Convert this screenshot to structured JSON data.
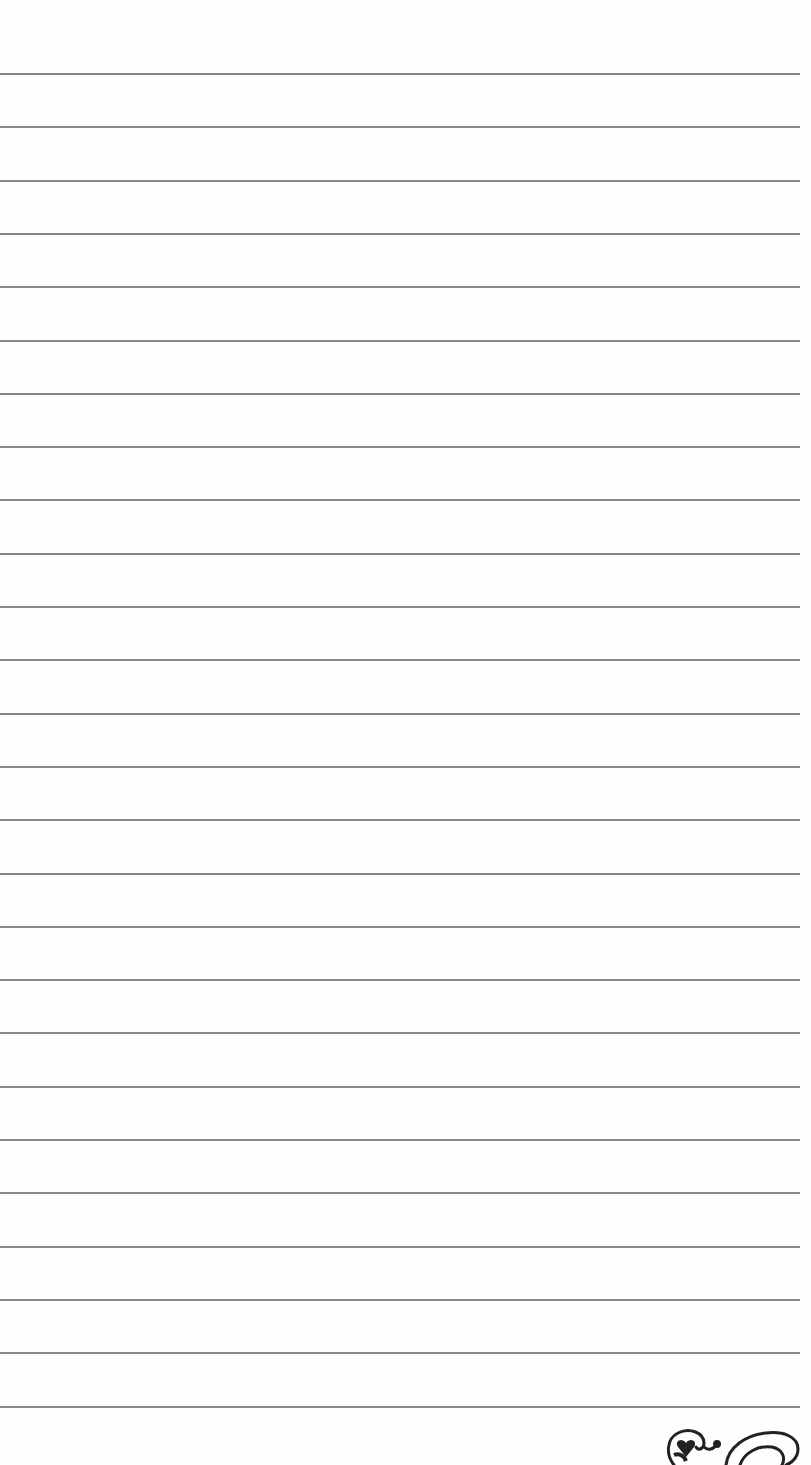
{
  "page": {
    "type": "lined-paper",
    "background_color": "#fefefe",
    "line_color": "#7a7a7a",
    "line_count": 26,
    "first_line_y": 73,
    "line_spacing": 53.3,
    "line_width": 800
  },
  "ornament": {
    "icon": "heart-swirl-flourish-icon",
    "position": "bottom-right"
  }
}
